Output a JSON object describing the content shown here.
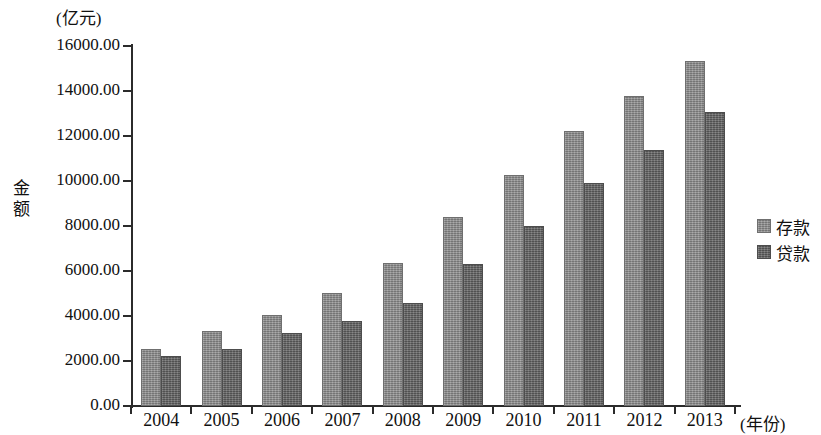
{
  "chart_data": {
    "type": "bar",
    "title": "",
    "unit_label": "(亿元)",
    "ylabel": "金额",
    "xlabel": "(年份)",
    "categories": [
      "2004",
      "2005",
      "2006",
      "2007",
      "2008",
      "2009",
      "2010",
      "2011",
      "2012",
      "2013"
    ],
    "series": [
      {
        "name": "存款",
        "color": "#8d8d8d",
        "values": [
          2550,
          3340,
          4040,
          5010,
          6340,
          8420,
          10250,
          12230,
          13760,
          15340
        ]
      },
      {
        "name": "贷款",
        "color": "#666666",
        "values": [
          2230,
          2540,
          3250,
          3800,
          4570,
          6320,
          7980,
          9900,
          11400,
          13080
        ]
      }
    ],
    "ylim": [
      0,
      16000
    ],
    "ytick_step": 2000,
    "ytick_labels": [
      "0.00",
      "2000.00",
      "4000.00",
      "6000.00",
      "8000.00",
      "10000.00",
      "12000.00",
      "14000.00",
      "16000.00"
    ],
    "ytick_values": [
      0,
      2000,
      4000,
      6000,
      8000,
      10000,
      12000,
      14000,
      16000
    ],
    "grid": false,
    "legend_position": "right"
  }
}
